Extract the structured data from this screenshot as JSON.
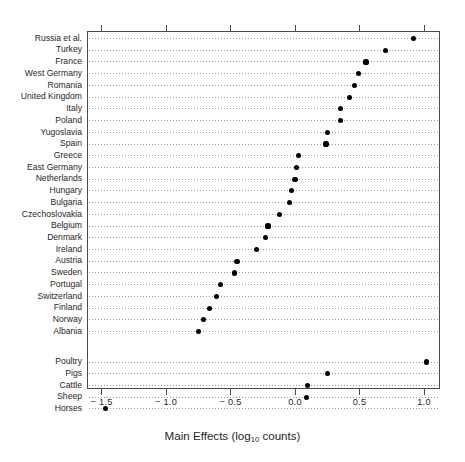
{
  "chart_data": {
    "type": "scatter",
    "subtype": "cleveland-dot-plot",
    "title": "",
    "xlabel": "Main Effects (log10 counts)",
    "xlabel_parts": {
      "pre": "Main Effects (log",
      "sub": "10",
      "post": " counts)"
    },
    "ylabel": "",
    "xlim": [
      -1.62,
      1.15
    ],
    "xticks": [
      -1.5,
      -1.0,
      -0.5,
      0.0,
      0.5,
      1.0
    ],
    "xticklabels": [
      "− 1.5",
      "− 1.0",
      "− 0.5",
      "0.0",
      "0.5",
      "1.0"
    ],
    "grid": "horizontal-dotted-per-category",
    "legend": "none",
    "marker": {
      "shape": "circle",
      "color": "#000000",
      "size_px": 5.2
    },
    "groups": [
      {
        "name": "Countries",
        "categories": [
          "Russia et al.",
          "Turkey",
          "France",
          "West Germany",
          "Romania",
          "United Kingdom",
          "Italy",
          "Poland",
          "Yugoslavia",
          "Spain",
          "Greece",
          "East Germany",
          "Netherlands",
          "Hungary",
          "Bulgaria",
          "Czechoslovakia",
          "Belgium",
          "Denmark",
          "Ireland",
          "Austria",
          "Sweden",
          "Portugal",
          "Switzerland",
          "Finland",
          "Norway",
          "Albania"
        ],
        "values": [
          0.92,
          0.7,
          0.55,
          0.49,
          0.46,
          0.42,
          0.35,
          0.35,
          0.25,
          0.24,
          0.03,
          0.01,
          0.0,
          -0.03,
          -0.04,
          -0.12,
          -0.21,
          -0.23,
          -0.3,
          -0.45,
          -0.47,
          -0.58,
          -0.61,
          -0.66,
          -0.71,
          -0.75
        ]
      },
      {
        "name": "Livestock",
        "categories": [
          "Poultry",
          "Pigs",
          "Cattle",
          "Sheep",
          "Horses"
        ],
        "values": [
          1.02,
          0.25,
          0.1,
          0.09,
          -1.47
        ]
      }
    ]
  },
  "axis": {
    "x_axis_name": "main-effects-axis",
    "tick_style": "outward"
  }
}
